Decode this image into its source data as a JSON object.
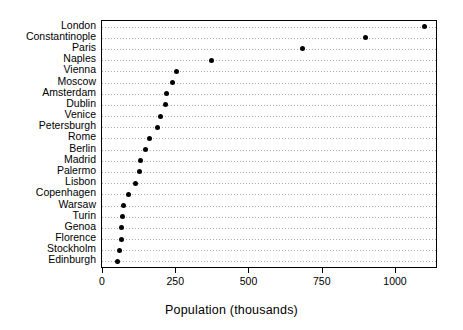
{
  "chart_data": {
    "type": "scatter",
    "title": "",
    "xlabel": "Population (thousands)",
    "ylabel": "",
    "orientation": "horizontal",
    "grid": true,
    "grid_style": "dotted",
    "legend": "none",
    "xlim": [
      0,
      1140
    ],
    "xticks": [
      0,
      250,
      500,
      750,
      1000
    ],
    "xticklabels": [
      "0",
      "250",
      "500",
      "750",
      "1000"
    ],
    "categories": [
      "London",
      "Constantinople",
      "Paris",
      "Naples",
      "Vienna",
      "Moscow",
      "Amsterdam",
      "Dublin",
      "Venice",
      "Petersburgh",
      "Rome",
      "Berlin",
      "Madrid",
      "Palermo",
      "Lisbon",
      "Copenhagen",
      "Warsaw",
      "Turin",
      "Genoa",
      "Florence",
      "Stockholm",
      "Edinburgh"
    ],
    "values": [
      1100,
      900,
      685,
      375,
      255,
      240,
      220,
      218,
      198,
      188,
      163,
      148,
      133,
      128,
      113,
      90,
      75,
      70,
      68,
      65,
      60,
      53
    ],
    "marker": "filled-circle",
    "marker_color": "#000000"
  }
}
